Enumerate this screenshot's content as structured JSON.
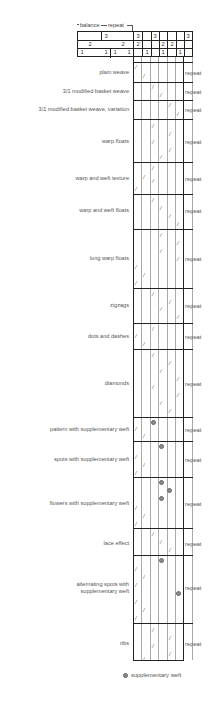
{
  "header": {
    "balance_label": "balance",
    "repeat_label": "repeat",
    "row3": [
      "3",
      "3",
      "3",
      "3"
    ],
    "row2": [
      "2",
      "2",
      "2",
      "2",
      "2"
    ],
    "row1": [
      "1",
      "1",
      "1",
      "1",
      "1",
      "1",
      "1"
    ]
  },
  "rows": [
    {
      "label": "plain weave",
      "repeat": "repeat"
    },
    {
      "label": "3/1 modified basket weave",
      "repeat": "repeat"
    },
    {
      "label": "3/1 modified basket weave, variation",
      "repeat": "repeat"
    },
    {
      "label": "warp floats",
      "repeat": "repeat"
    },
    {
      "label": "warp and weft texture",
      "repeat": "repeat"
    },
    {
      "label": "warp and weft floats",
      "repeat": "repeat"
    },
    {
      "label": "long warp floats",
      "repeat": "repeat"
    },
    {
      "label": "zigzags",
      "repeat": "repeat"
    },
    {
      "label": "dots and dashes",
      "repeat": "repeat"
    },
    {
      "label": "diamonds",
      "repeat": "repeat"
    },
    {
      "label": "pattern with supplementary weft",
      "repeat": "repeat"
    },
    {
      "label": "spots with supplementary weft",
      "repeat": "repeat"
    },
    {
      "label": "flowers with supplementary weft",
      "repeat": "repeat"
    },
    {
      "label": "lace effect",
      "repeat": "repeat"
    },
    {
      "label": "alternating spots with",
      "label2": "supplementary weft",
      "repeat": "repeat"
    },
    {
      "label": "ribs",
      "repeat": "repeat"
    }
  ],
  "legend": {
    "label": "supplementary weft"
  },
  "colors": {
    "grid": "#222222",
    "thread": "#999999",
    "dot": "#8a8a8a"
  }
}
